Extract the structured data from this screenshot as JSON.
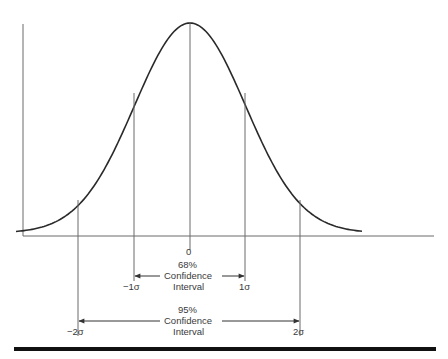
{
  "chart_data": {
    "type": "line",
    "title": "",
    "xlabel": "",
    "ylabel": "",
    "x_ticks": [
      "−2σ",
      "−1σ",
      "0",
      "1σ",
      "2σ"
    ],
    "series": [
      {
        "name": "normal distribution",
        "x": [
          -3,
          -2.5,
          -2,
          -1.5,
          -1,
          -0.5,
          0,
          0.5,
          1,
          1.5,
          2,
          2.5,
          3
        ],
        "y": [
          0.004,
          0.018,
          0.054,
          0.13,
          0.242,
          0.352,
          0.399,
          0.352,
          0.242,
          0.13,
          0.054,
          0.018,
          0.004
        ]
      }
    ],
    "annotations": [
      {
        "label": "68% Confidence Interval",
        "from": "−1σ",
        "to": "1σ"
      },
      {
        "label": "95% Confidence Interval",
        "from": "−2σ",
        "to": "2σ"
      }
    ],
    "grid": false,
    "legend": null
  },
  "labels": {
    "zero": "0",
    "minus_one_sigma": "−1σ",
    "one_sigma": "1σ",
    "minus_two_sigma": "−2σ",
    "two_sigma": "2σ",
    "ci68_pct": "68%",
    "ci68_line1": "Confidence",
    "ci68_line2": "Interval",
    "ci95_pct": "95%",
    "ci95_line1": "Confidence",
    "ci95_line2": "Interval"
  },
  "colors": {
    "curve": "#2a2a2a",
    "lines": "#6a6a6a",
    "rule": "#111111"
  }
}
